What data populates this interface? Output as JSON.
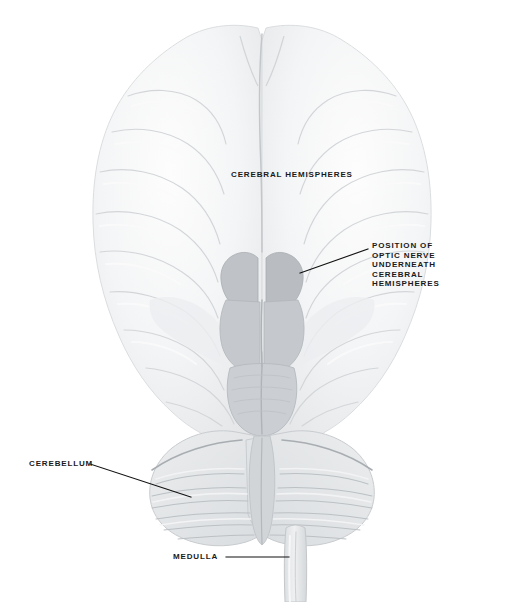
{
  "figure": {
    "background_color": "#ffffff",
    "ink_color": "#1a1a1a",
    "brain_tone_light": "#f2f3f4",
    "brain_tone_mid": "#e2e4e6",
    "brain_tone_dark": "#c9ccd0",
    "brainstem_tone": "#bcc0c4"
  },
  "labels": {
    "cerebral_hemispheres": {
      "text": "CEREBRAL  HEMISPHERES",
      "has_leader": false
    },
    "optic_nerve": {
      "line1": "POSITION  OF",
      "line2": "OPTIC  NERVE",
      "line3": "UNDERNEATH",
      "line4": "CEREBRAL",
      "line5": "HEMISPHERES",
      "has_leader": true
    },
    "cerebellum": {
      "text": "CEREBELLUM",
      "has_leader": true
    },
    "medulla": {
      "text": "MEDULLA",
      "has_leader": true
    }
  },
  "leaders": [
    {
      "name": "optic-nerve-leader",
      "x1": 368,
      "y1": 249,
      "x2": 300,
      "y2": 273
    },
    {
      "name": "cerebellum-leader",
      "x1": 90,
      "y1": 464,
      "x2": 191,
      "y2": 497
    },
    {
      "name": "medulla-leader",
      "x1": 226,
      "y1": 557,
      "x2": 289,
      "y2": 557
    }
  ]
}
